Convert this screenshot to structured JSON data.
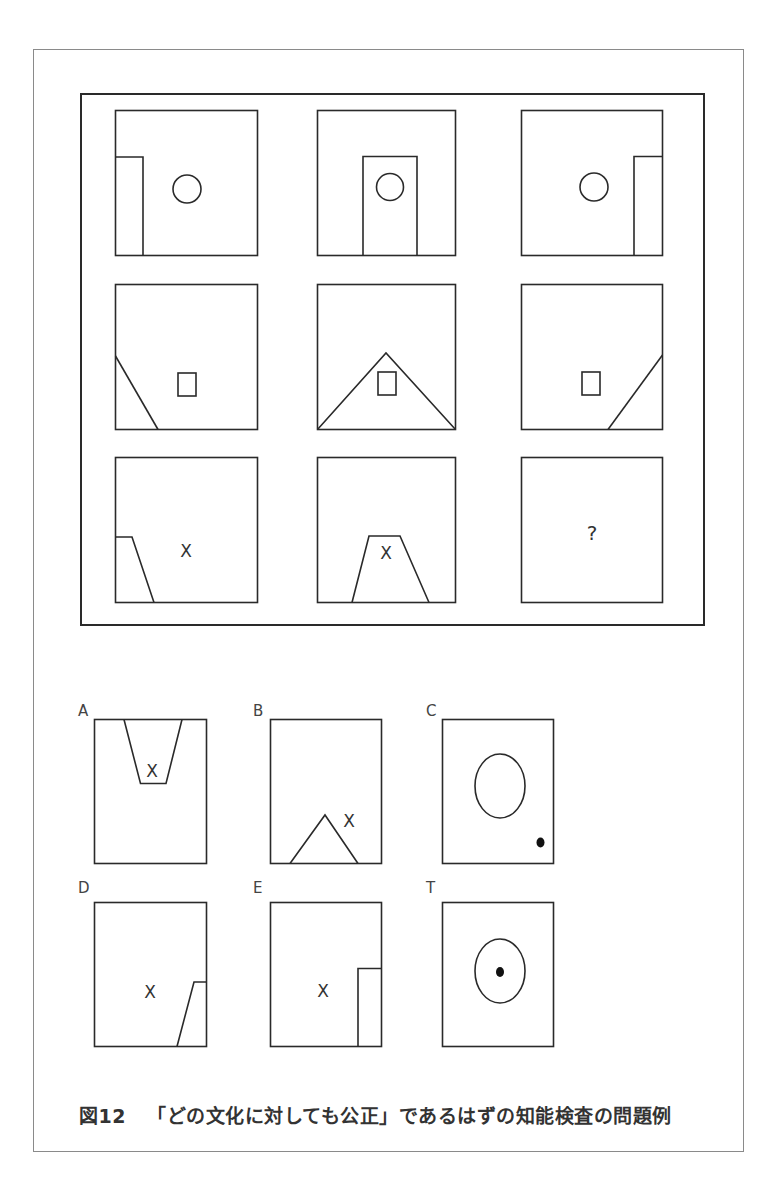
{
  "caption": {
    "figure_number": "図12",
    "text": "「どの文化に対しても公正」であるはずの知能検査の問題例"
  },
  "matrix": {
    "rows": [
      [
        {
          "shape": "circle",
          "overlay": "rectangle-left"
        },
        {
          "shape": "circle",
          "overlay": "rectangle-center"
        },
        {
          "shape": "circle",
          "overlay": "rectangle-right"
        }
      ],
      [
        {
          "shape": "square",
          "overlay": "diagonal-left"
        },
        {
          "shape": "square",
          "overlay": "triangle-center"
        },
        {
          "shape": "square",
          "overlay": "diagonal-right"
        }
      ],
      [
        {
          "shape": "x-mark",
          "overlay": "trapezoid-left"
        },
        {
          "shape": "x-mark",
          "overlay": "trapezoid-center"
        },
        {
          "shape": "question-mark",
          "overlay": "none",
          "text": "?"
        }
      ]
    ]
  },
  "options": [
    {
      "label": "A",
      "content": "inverted trapezoid at top with X"
    },
    {
      "label": "B",
      "content": "triangle at bottom with X"
    },
    {
      "label": "C",
      "content": "large circle with small filled dot bottom-right"
    },
    {
      "label": "D",
      "content": "X with trapezoid bottom-right"
    },
    {
      "label": "E",
      "content": "X with rectangle bottom-right"
    },
    {
      "label": "T",
      "content": "circle with filled dot in center"
    }
  ],
  "glyphs": {
    "x_mark": "X",
    "question": "?"
  },
  "colors": {
    "line": "#2a2a2a",
    "frame": "#8a8a8a",
    "text": "#333333"
  }
}
